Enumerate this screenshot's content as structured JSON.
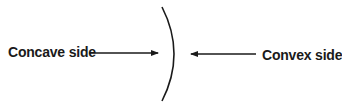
{
  "diagram": {
    "left_label": "Concave side",
    "right_label": "Convex side",
    "colors": {
      "stroke": "#1a1a1a",
      "text": "#1a1a1a",
      "background": "#ffffff"
    }
  }
}
